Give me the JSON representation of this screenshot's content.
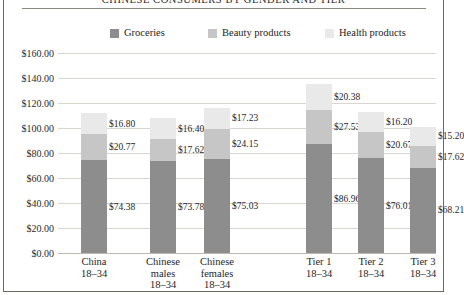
{
  "chart_data": {
    "type": "bar",
    "subtype": "stacked-column",
    "title": "CHINESE CONSUMERS BY GENDER AND TIER",
    "xlabel": "",
    "ylabel": "",
    "ylim": [
      0,
      160
    ],
    "ytick_step": 20,
    "ytick_labels": [
      "$0.00",
      "$20.00",
      "$40.00",
      "$60.00",
      "$80.00",
      "$100.00",
      "$120.00",
      "$140.00",
      "$160.00"
    ],
    "ytick_values": [
      0,
      20,
      40,
      60,
      80,
      100,
      120,
      140,
      160
    ],
    "grid": "horizontal",
    "legend_position": "top",
    "categories": [
      "China 18–34",
      "Chinese males 18–34",
      "Chinese females 18–34",
      "Tier 1 18–34",
      "Tier 2 18–34",
      "Tier 3 18–34"
    ],
    "category_lines": [
      [
        "China",
        "18–34"
      ],
      [
        "Chinese",
        "males",
        "18–34"
      ],
      [
        "Chinese",
        "females",
        "18–34"
      ],
      [
        "Tier 1",
        "18–34"
      ],
      [
        "Tier 2",
        "18–34"
      ],
      [
        "Tier 3",
        "18–34"
      ]
    ],
    "series": [
      {
        "name": "Groceries",
        "color": "#8d8d8d",
        "values": [
          74.38,
          73.78,
          75.03,
          86.96,
          76.01,
          68.21
        ],
        "labels": [
          "$74.38",
          "$73.78",
          "$75.03",
          "$86.96",
          "$76.01",
          "$68.21"
        ]
      },
      {
        "name": "Beauty products",
        "color": "#c6c6c6",
        "values": [
          20.77,
          17.62,
          24.15,
          27.53,
          20.67,
          17.62
        ],
        "labels": [
          "$20.77",
          "$17.62",
          "$24.15",
          "$27.53",
          "$20.67",
          "$17.62"
        ]
      },
      {
        "name": "Health products",
        "color": "#e9e9e9",
        "values": [
          16.8,
          16.4,
          17.23,
          20.38,
          16.2,
          15.2
        ],
        "labels": [
          "$16.80",
          "$16.40",
          "$17.23",
          "$20.38",
          "$16.20",
          "$15.20"
        ]
      }
    ],
    "totals": [
      111.95,
      107.8,
      116.41,
      134.87,
      112.88,
      101.03
    ]
  },
  "legend": {
    "items": [
      {
        "label": "Groceries",
        "color": "#8d8d8d"
      },
      {
        "label": "Beauty products",
        "color": "#c6c6c6"
      },
      {
        "label": "Health products",
        "color": "#e9e9e9"
      }
    ]
  }
}
